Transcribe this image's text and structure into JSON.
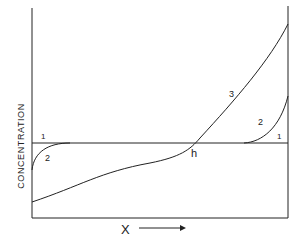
{
  "figure": {
    "y_axis_label": "CONCENTRATION",
    "x_axis_label": "X",
    "x_arrow": "right-arrow",
    "curves": [
      {
        "id": "1",
        "label": "1",
        "description": "horizontal constant-concentration line"
      },
      {
        "id": "2",
        "label": "2",
        "description": "rises at both boundaries toward line 1"
      },
      {
        "id": "3",
        "label": "3",
        "description": "monotonically increasing curve crossing line 1 at h"
      }
    ],
    "labels": {
      "curve1_left": "1",
      "curve1_right": "1",
      "curve2_left": "2",
      "curve2_right": "2",
      "curve3": "3",
      "intersection": "h"
    },
    "line_color": "#222222",
    "background": "#ffffff"
  }
}
